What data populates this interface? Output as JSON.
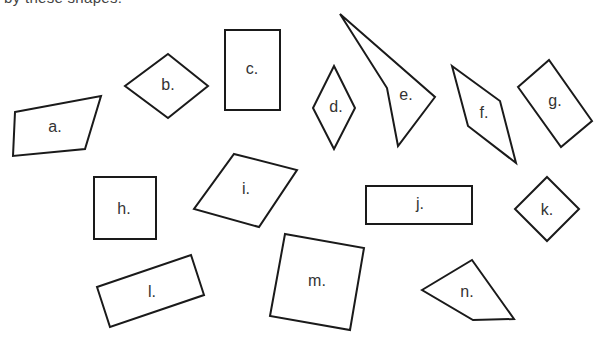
{
  "header": {
    "cut_off_text": "by these shapes:"
  },
  "colors": {
    "stroke": "#1a1a1a",
    "label": "#333333",
    "background": "#ffffff"
  },
  "shapes": [
    {
      "label": "a.",
      "kind": "irregular-quadrilateral",
      "points": "15,112 101,96 85,149 13,156",
      "lx": 55,
      "ly": 128
    },
    {
      "label": "b.",
      "kind": "rhombus",
      "points": "168,54 208,86 168,118 125,86",
      "lx": 168,
      "ly": 86
    },
    {
      "label": "c.",
      "kind": "rectangle",
      "points": "225,30 280,30 280,110 225,110",
      "lx": 252,
      "ly": 70
    },
    {
      "label": "d.",
      "kind": "rhombus",
      "points": "334,66 355,108 334,149 313,108",
      "lx": 336,
      "ly": 108
    },
    {
      "label": "e.",
      "kind": "concave-quadrilateral",
      "points": "340,14 435,97 398,146 387,88",
      "lx": 406,
      "ly": 96
    },
    {
      "label": "f.",
      "kind": "parallelogram",
      "points": "452,66 500,101 516,163 468,126",
      "lx": 484,
      "ly": 114
    },
    {
      "label": "g.",
      "kind": "rectangle",
      "points": "518,87 549,60 592,121 561,147",
      "lx": 555,
      "ly": 102
    },
    {
      "label": "h.",
      "kind": "square",
      "points": "94,177 156,177 156,239 94,239",
      "lx": 124,
      "ly": 210
    },
    {
      "label": "i.",
      "kind": "parallelogram",
      "points": "234,154 297,170 259,227 194,209",
      "lx": 246,
      "ly": 190
    },
    {
      "label": "j.",
      "kind": "rectangle",
      "points": "366,186 472,186 472,224 366,224",
      "lx": 420,
      "ly": 205
    },
    {
      "label": "k.",
      "kind": "square-rotated",
      "points": "547,177 579,209 547,241 515,209",
      "lx": 547,
      "ly": 211
    },
    {
      "label": "l.",
      "kind": "rectangle-rotated",
      "points": "97,287 191,255 204,295 110,327",
      "lx": 152,
      "ly": 293
    },
    {
      "label": "m.",
      "kind": "square-rotated",
      "points": "285,234 364,248 350,330 270,316",
      "lx": 317,
      "ly": 282
    },
    {
      "label": "n.",
      "kind": "irregular-quadrilateral",
      "points": "422,290 472,260 514,319 473,320",
      "lx": 467,
      "ly": 293
    }
  ]
}
